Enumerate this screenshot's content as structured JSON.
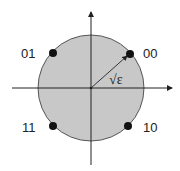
{
  "diagram": {
    "colors": {
      "disk_fill": "#c8c8c8",
      "stroke": "#222222",
      "background": "#ffffff"
    },
    "radius_label": "√ε",
    "points": [
      {
        "label": "00",
        "quadrant": "upper-right"
      },
      {
        "label": "01",
        "quadrant": "upper-left"
      },
      {
        "label": "11",
        "quadrant": "lower-left"
      },
      {
        "label": "10",
        "quadrant": "lower-right"
      }
    ]
  }
}
